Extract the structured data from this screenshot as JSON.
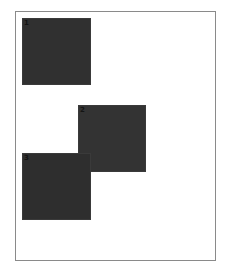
{
  "canvas": {
    "background": "#ffffff",
    "frame_border_color": "#8a8a8a"
  },
  "squares": [
    {
      "label": "1",
      "left": 22,
      "top": 18,
      "width": 69,
      "height": 67,
      "fill": "#303030",
      "z": 1
    },
    {
      "label": "2",
      "left": 78,
      "top": 105,
      "width": 68,
      "height": 67,
      "fill": "#333333",
      "z": 1
    },
    {
      "label": "3",
      "left": 22,
      "top": 153,
      "width": 69,
      "height": 67,
      "fill": "#2e2e2e",
      "z": 2
    }
  ]
}
